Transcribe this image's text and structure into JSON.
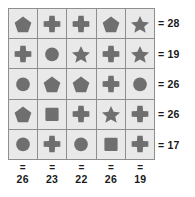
{
  "puzzle": {
    "title": "shape-sum-grid",
    "colors": {
      "cell_background": "#e9e9e9",
      "grid_line": "#8e8e8e",
      "shape": "#6f6f6f",
      "text": "#1a1a1a",
      "page_background": "#ffffff"
    },
    "equals_sign": "=",
    "rows": 5,
    "cols": 5,
    "cells": [
      [
        "pentagon",
        "cross",
        "cross",
        "pentagon",
        "star"
      ],
      [
        "cross",
        "circle",
        "star",
        "cross",
        "star"
      ],
      [
        "circle",
        "pentagon",
        "pentagon",
        "cross",
        "circle"
      ],
      [
        "pentagon",
        "square",
        "cross",
        "star",
        "cross"
      ],
      [
        "circle",
        "cross",
        "circle",
        "square",
        "cross"
      ]
    ],
    "row_sums": [
      "28",
      "19",
      "26",
      "26",
      "17"
    ],
    "col_sums": [
      "26",
      "23",
      "22",
      "26",
      "19"
    ]
  }
}
